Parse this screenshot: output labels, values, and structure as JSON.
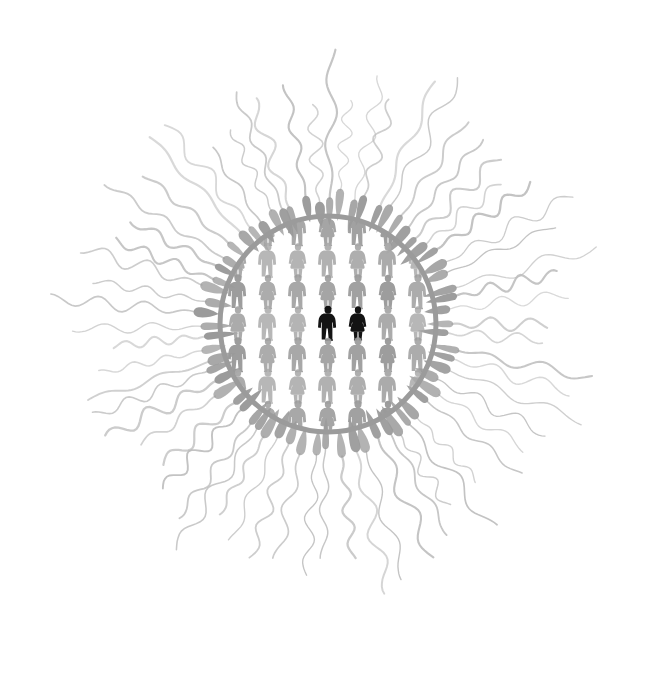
{
  "canvas": {
    "width": 658,
    "height": 686,
    "background": "#ffffff",
    "title": "Conception — one couple surrounded by a crowd, circle besieged by sperm"
  },
  "palette": {
    "background": "#ffffff",
    "crowd_figure": "#9a9a9a",
    "crowd_figure_light": "#a8a8a8",
    "highlight_figure": "#131313",
    "circle_ring": "#9b9b9b",
    "sperm_head": "#9a9a9a",
    "sperm_tail": "#bcbcbc"
  },
  "circle": {
    "label": "ovum-boundary-ring",
    "cx": 328,
    "cy": 324,
    "radius": 108,
    "stroke_width": 5,
    "stroke_color": "#9b9b9b",
    "fill": "none"
  },
  "crowd": {
    "label": "crowd-of-people",
    "rows": 7,
    "columns": 15,
    "col_spacing": 30,
    "row_spacing": 31.5,
    "figure_height": 33,
    "origin_x": 328,
    "origin_y": 324,
    "alternation": "male-female-alternating-by-column-and-row",
    "description": "Grid of human pictograms clipped inside the circle",
    "highlight": {
      "label": "highlighted-couple",
      "count": 2,
      "members": [
        "man",
        "woman"
      ],
      "color": "#131313",
      "row_index": 3,
      "col_indices": [
        7,
        8
      ]
    }
  },
  "sperm_field": {
    "label": "sperm-radial-field",
    "count": 64,
    "inner_radius": 116,
    "head_length": 26,
    "head_width": 9,
    "tail_length_min": 86,
    "tail_length_max": 150,
    "head_color": "#9a9a9a",
    "tail_color": "#bcbcbc",
    "tail_stroke_width": 1.7,
    "direction": "heads point inward toward circle, wavy tails trail outward",
    "wave_amplitude": 7,
    "wave_cycles": 2.6
  },
  "accessibility": {
    "alt_text": "A large circle filled with small gray human figures; at its center one man and one woman are drawn in black. Dozens of gray sperm with long wavy tails radiate outward from the circle in every direction, like rays of a sun."
  }
}
